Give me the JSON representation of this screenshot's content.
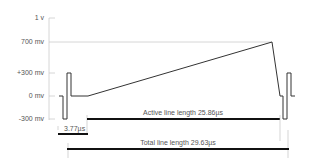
{
  "diagram": {
    "y_axis": {
      "labels": [
        "1 v",
        "700 mv",
        "+300 mv",
        "0 mv",
        "-300 mv"
      ]
    },
    "annotations": {
      "sync": "3.77µs",
      "active": "Active line length 25.86µs",
      "total": "Total line length 29.63µs"
    },
    "colors": {
      "waveform": "#333333",
      "bars": "#111111",
      "gridline": "#cccccc",
      "text": "#555555"
    }
  }
}
